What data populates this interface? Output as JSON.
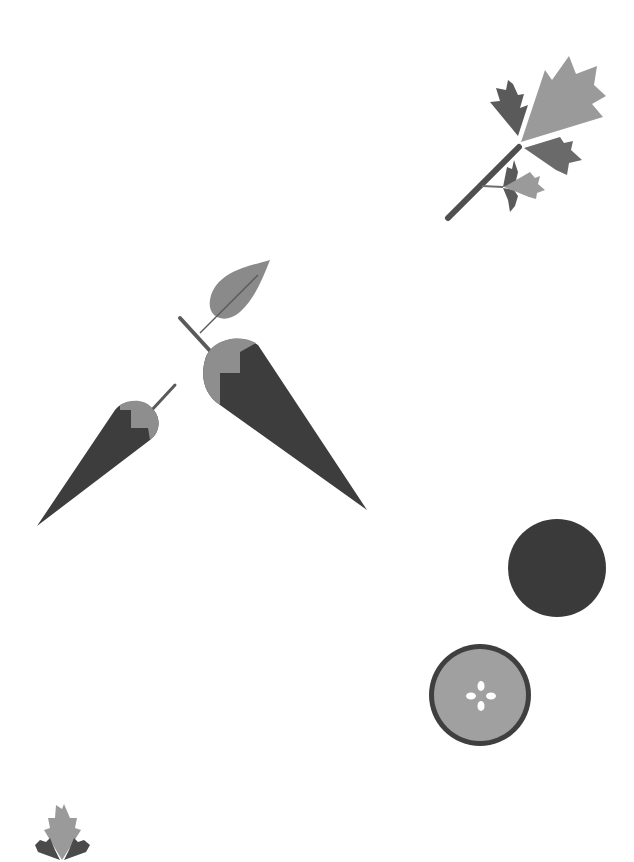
{
  "illustration": {
    "subject": "vegetable illustration",
    "elements": [
      {
        "name": "parsley-sprig-large",
        "position": "top-right"
      },
      {
        "name": "carrot-large",
        "position": "center"
      },
      {
        "name": "carrot-leaf",
        "position": "center-top"
      },
      {
        "name": "carrot-small",
        "position": "center-left"
      },
      {
        "name": "carrot-slice-dark",
        "position": "right"
      },
      {
        "name": "carrot-slice-cross-section",
        "position": "bottom-right"
      },
      {
        "name": "parsley-sprig-small",
        "position": "bottom-left"
      }
    ]
  },
  "colors": {
    "background": "#ffffff",
    "dark": "#3a3a3a",
    "mid": "#6e6e6e",
    "light": "#9a9a9a",
    "stem": "#4f4f4f",
    "seed": "#ffffff"
  }
}
